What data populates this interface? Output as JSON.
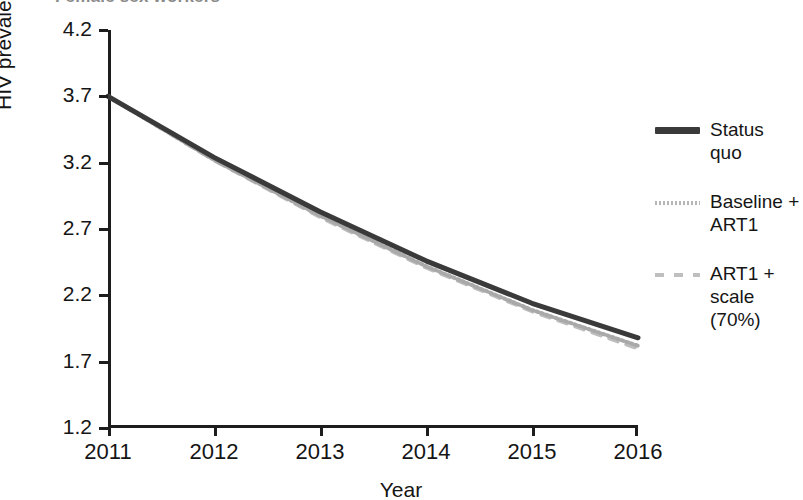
{
  "chart_data": {
    "type": "line",
    "title": "Female sex workers",
    "xlabel": "Year",
    "ylabel": "HIV prevalence (percent)",
    "x": [
      2011,
      2012,
      2013,
      2014,
      2015,
      2016
    ],
    "xtick_labels": [
      "2011",
      "2012",
      "2013",
      "2014",
      "2015",
      "2016"
    ],
    "ytick_labels": [
      "1.2",
      "1.7",
      "2.2",
      "2.7",
      "3.2",
      "3.7",
      "4.2"
    ],
    "yticks": [
      1.2,
      1.7,
      2.2,
      2.7,
      3.2,
      3.7,
      4.2
    ],
    "ylim": [
      1.2,
      4.2
    ],
    "xlim": [
      2011,
      2016
    ],
    "grid": false,
    "legend_position": "right",
    "series": [
      {
        "name": "Status quo",
        "label_lines": [
          "Status",
          "quo"
        ],
        "style": "solid",
        "color": "#3a3a3a",
        "width": 5,
        "values": [
          3.7,
          3.24,
          2.83,
          2.46,
          2.14,
          1.88
        ]
      },
      {
        "name": "Baseline + ART1",
        "label_lines": [
          "Baseline +",
          "ART1"
        ],
        "style": "dotted",
        "color": "#a9a9a9",
        "width": 4,
        "values": [
          3.7,
          3.22,
          2.8,
          2.42,
          2.09,
          1.82
        ]
      },
      {
        "name": "ART1 + scale (70%)",
        "label_lines": [
          "ART1 +",
          "scale (70%)"
        ],
        "style": "dashed",
        "color": "#bdbdbd",
        "width": 4,
        "values": [
          3.7,
          3.22,
          2.79,
          2.41,
          2.08,
          1.8
        ]
      }
    ]
  },
  "axes": {
    "y_label": "HIV prevalence (percent)",
    "x_label": "Year",
    "y_ticks": [
      "4.2",
      "3.7",
      "3.2",
      "2.7",
      "2.2",
      "1.7",
      "1.2"
    ],
    "x_ticks": [
      "2011",
      "2012",
      "2013",
      "2014",
      "2015",
      "2016"
    ]
  },
  "legend": {
    "entries": [
      {
        "label": "Status quo",
        "line1": "Status",
        "line2": "quo",
        "swatch": "solid-thick-dark-line-icon"
      },
      {
        "label": "Baseline + ART1",
        "line1": "Baseline +",
        "line2": "ART1",
        "swatch": "dotted-gray-line-icon"
      },
      {
        "label": "ART1 + scale (70%)",
        "line1": "ART1 +",
        "line2": "scale (70%)",
        "swatch": "dashed-light-gray-line-icon"
      }
    ]
  },
  "title": {
    "text": "Female sex workers"
  },
  "colors": {
    "status_quo": "#3a3a3a",
    "baseline_art1": "#a9a9a9",
    "art1_scale": "#bdbdbd",
    "axis": "#1d1d1d",
    "background": "#ffffff"
  }
}
